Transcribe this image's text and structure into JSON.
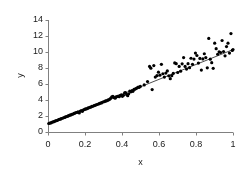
{
  "chart_data": {
    "type": "scatter",
    "title": "",
    "xlabel": "x",
    "ylabel": "y",
    "xlim": [
      0,
      1
    ],
    "ylim": [
      0,
      14
    ],
    "xticks": [
      "0",
      "0.2",
      "0.4",
      "0.6",
      "0.8",
      "1"
    ],
    "xtick_values": [
      0,
      0.2,
      0.4,
      0.6,
      0.8,
      1
    ],
    "yticks": [
      "0",
      "2",
      "4",
      "6",
      "8",
      "10",
      "12",
      "14"
    ],
    "ytick_values": [
      0,
      2,
      4,
      6,
      8,
      10,
      12,
      14
    ],
    "grid": false,
    "legend": null,
    "marker": "filled-circle",
    "marker_color": "#000000",
    "marker_size_px": 3.2,
    "axis_color": "#808080",
    "fit_line": {
      "type": "linear-regression",
      "color": "#3a3a3a",
      "width_px": 0.9,
      "intercept": 1.0,
      "slope": 9.3,
      "x_start": 0.0,
      "x_end": 1.0,
      "y_start": 1.0,
      "y_end": 10.3
    },
    "note": "Heteroscedastic scatter: residual spread grows with x",
    "series": [
      {
        "name": "observations",
        "x": [
          0.004,
          0.01,
          0.016,
          0.021,
          0.027,
          0.033,
          0.038,
          0.044,
          0.05,
          0.055,
          0.061,
          0.067,
          0.072,
          0.078,
          0.084,
          0.09,
          0.095,
          0.101,
          0.107,
          0.112,
          0.118,
          0.124,
          0.129,
          0.135,
          0.141,
          0.146,
          0.152,
          0.158,
          0.163,
          0.169,
          0.175,
          0.181,
          0.186,
          0.192,
          0.198,
          0.203,
          0.209,
          0.215,
          0.22,
          0.226,
          0.232,
          0.237,
          0.243,
          0.249,
          0.254,
          0.26,
          0.266,
          0.272,
          0.277,
          0.283,
          0.289,
          0.294,
          0.3,
          0.306,
          0.311,
          0.317,
          0.323,
          0.328,
          0.334,
          0.34,
          0.345,
          0.351,
          0.357,
          0.363,
          0.368,
          0.374,
          0.38,
          0.385,
          0.391,
          0.397,
          0.402,
          0.408,
          0.414,
          0.419,
          0.425,
          0.431,
          0.436,
          0.442,
          0.448,
          0.454,
          0.459,
          0.465,
          0.471,
          0.476,
          0.482,
          0.488,
          0.493,
          0.499,
          0.52,
          0.538,
          0.549,
          0.556,
          0.563,
          0.572,
          0.58,
          0.589,
          0.597,
          0.605,
          0.613,
          0.621,
          0.629,
          0.637,
          0.645,
          0.653,
          0.661,
          0.669,
          0.677,
          0.685,
          0.693,
          0.701,
          0.709,
          0.717,
          0.725,
          0.733,
          0.741,
          0.749,
          0.757,
          0.765,
          0.773,
          0.781,
          0.789,
          0.797,
          0.805,
          0.813,
          0.821,
          0.829,
          0.837,
          0.845,
          0.853,
          0.861,
          0.869,
          0.877,
          0.885,
          0.893,
          0.901,
          0.909,
          0.917,
          0.925,
          0.933,
          0.941,
          0.949,
          0.957,
          0.965,
          0.973,
          0.981,
          0.989,
          0.996,
          1.0
        ],
        "y": [
          1.06,
          1.12,
          1.14,
          1.22,
          1.26,
          1.3,
          1.37,
          1.42,
          1.44,
          1.53,
          1.58,
          1.6,
          1.68,
          1.72,
          1.78,
          1.82,
          1.88,
          1.94,
          1.98,
          2.04,
          2.1,
          2.14,
          2.22,
          2.24,
          2.32,
          2.36,
          2.44,
          2.46,
          2.52,
          2.38,
          2.62,
          2.66,
          2.58,
          2.78,
          2.82,
          2.88,
          2.9,
          2.98,
          3.02,
          3.08,
          3.12,
          3.2,
          3.22,
          3.3,
          3.34,
          3.4,
          3.44,
          3.5,
          3.54,
          3.62,
          3.64,
          3.72,
          3.78,
          3.8,
          3.88,
          3.9,
          3.98,
          4.02,
          4.1,
          4.24,
          4.38,
          4.46,
          4.3,
          4.22,
          4.38,
          4.44,
          4.48,
          4.42,
          4.58,
          4.64,
          4.46,
          4.58,
          4.88,
          4.92,
          4.68,
          4.54,
          4.78,
          5.12,
          5.02,
          5.16,
          5.08,
          5.32,
          5.36,
          5.44,
          5.52,
          5.62,
          5.58,
          5.7,
          5.88,
          6.3,
          8.2,
          7.98,
          5.3,
          8.3,
          6.86,
          7.04,
          7.48,
          7.1,
          8.46,
          7.28,
          6.86,
          7.36,
          7.64,
          7.02,
          6.66,
          7.04,
          7.32,
          8.64,
          8.54,
          7.44,
          8.2,
          7.6,
          8.52,
          9.3,
          8.2,
          7.86,
          8.54,
          8.04,
          9.22,
          8.46,
          9.12,
          9.86,
          9.56,
          8.62,
          9.2,
          7.74,
          9.14,
          9.78,
          9.3,
          8.02,
          11.7,
          9.1,
          8.66,
          7.96,
          11.1,
          10.42,
          9.72,
          10.02,
          9.94,
          11.44,
          10.06,
          9.52,
          10.68,
          11.1,
          9.86,
          12.3,
          10.2,
          10.3
        ]
      }
    ]
  },
  "axis_labels": {
    "x": "x",
    "y": "y"
  }
}
